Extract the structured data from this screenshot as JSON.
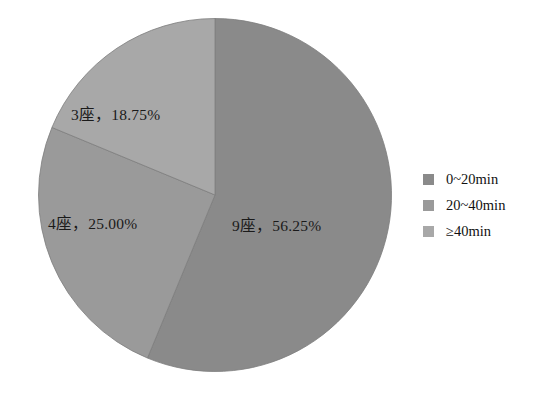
{
  "chart_data": {
    "type": "pie",
    "title": "",
    "categories": [
      "0~20min",
      "20~40min",
      "≥40min"
    ],
    "values": [
      56.25,
      25.0,
      18.75
    ],
    "counts": [
      9,
      4,
      3
    ],
    "count_unit": "座",
    "labels": [
      "9座，56.25%",
      "4座，25.00%",
      "3座，18.75%"
    ],
    "colors": [
      "#8a8a8a",
      "#9a9a9a",
      "#a8a8a8"
    ],
    "start_angle_deg": 0,
    "direction": "clockwise",
    "legend_position": "right",
    "grid": false,
    "xlabel": "",
    "ylabel": ""
  },
  "slices": [
    {
      "label": "9座，56.25%",
      "count": 9,
      "percent": "56.25%",
      "category": "0~20min",
      "color": "#8a8a8a"
    },
    {
      "label": "4座，25.00%",
      "count": 4,
      "percent": "25.00%",
      "category": "20~40min",
      "color": "#9a9a9a"
    },
    {
      "label": "3座，18.75%",
      "count": 3,
      "percent": "18.75%",
      "category": "≥40min",
      "color": "#a8a8a8"
    }
  ],
  "legend": {
    "items": [
      {
        "label": "0~20min",
        "color": "#8a8a8a"
      },
      {
        "label": "20~40min",
        "color": "#9a9a9a"
      },
      {
        "label": "≥40min",
        "color": "#a8a8a8"
      }
    ]
  }
}
